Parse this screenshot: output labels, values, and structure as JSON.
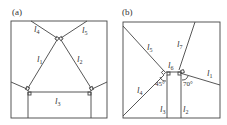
{
  "panels": [
    {
      "id": "a",
      "label": "(a)",
      "segments": [
        {
          "name": "l1",
          "main": "l",
          "sub": "1"
        },
        {
          "name": "l2",
          "main": "l",
          "sub": "2"
        },
        {
          "name": "l3",
          "main": "l",
          "sub": "3"
        },
        {
          "name": "l4",
          "main": "l",
          "sub": "4"
        },
        {
          "name": "l5",
          "main": "l",
          "sub": "5"
        }
      ]
    },
    {
      "id": "b",
      "label": "(b)",
      "segments": [
        {
          "name": "l1",
          "main": "l",
          "sub": "1"
        },
        {
          "name": "l2",
          "main": "l",
          "sub": "2"
        },
        {
          "name": "l3",
          "main": "l",
          "sub": "3"
        },
        {
          "name": "l4",
          "main": "l",
          "sub": "4"
        },
        {
          "name": "l5",
          "main": "l",
          "sub": "5"
        },
        {
          "name": "l6",
          "main": "l",
          "sub": "6"
        },
        {
          "name": "l7",
          "main": "l",
          "sub": "7"
        }
      ],
      "angles": [
        "45°",
        "70°"
      ]
    }
  ]
}
